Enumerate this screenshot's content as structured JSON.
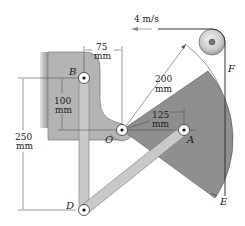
{
  "diagram": {
    "type": "mechanism",
    "labels": {
      "B": "B",
      "O": "O",
      "A": "A",
      "D": "D",
      "E": "E",
      "F": "F"
    },
    "dimensions": {
      "horizontal_75": {
        "value": "75",
        "unit": "mm"
      },
      "vertical_100": {
        "value": "100",
        "unit": "mm"
      },
      "vertical_250": {
        "value": "250",
        "unit": "mm"
      },
      "radius_200": {
        "value": "200",
        "unit": "mm"
      },
      "radius_125": {
        "value": "125",
        "unit": "mm"
      }
    },
    "velocity": {
      "text": "4 m/s"
    },
    "colors": {
      "bracket": "#b4b4b4",
      "sector": "#8f8f8f",
      "link": "#c8c8c8",
      "wall": "#cfcfcf",
      "pulley": "#d8d8d8"
    }
  }
}
